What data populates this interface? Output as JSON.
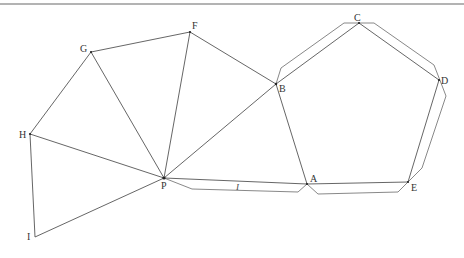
{
  "diagram": {
    "type": "net",
    "colors": {
      "line": "#555555",
      "tab": "#6a6a6a",
      "border": "#9a9a9a",
      "label": "#333333"
    },
    "vertices": {
      "A": {
        "label": "A",
        "x": 307,
        "y": 184
      },
      "B": {
        "label": "B",
        "x": 276,
        "y": 84
      },
      "C": {
        "label": "C",
        "x": 359,
        "y": 23
      },
      "D": {
        "label": "D",
        "x": 439,
        "y": 80
      },
      "E": {
        "label": "E",
        "x": 408,
        "y": 182
      },
      "F": {
        "label": "F",
        "x": 190,
        "y": 32
      },
      "G": {
        "label": "G",
        "x": 91,
        "y": 52
      },
      "H": {
        "label": "H",
        "x": 30,
        "y": 134
      },
      "I": {
        "label": "I",
        "x": 35,
        "y": 237
      },
      "P": {
        "label": "P",
        "x": 164,
        "y": 178
      }
    },
    "tab_label": "I"
  }
}
